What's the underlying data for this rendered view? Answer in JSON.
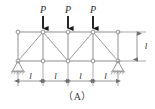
{
  "figure": {
    "caption": "（A）"
  },
  "loads": [
    {
      "label": "P",
      "node": "T2"
    },
    {
      "label": "P",
      "node": "T3"
    },
    {
      "label": "P",
      "node": "T4"
    }
  ],
  "dimensions": {
    "horizontal": [
      {
        "label": "l"
      },
      {
        "label": "l"
      },
      {
        "label": "l"
      },
      {
        "label": "l"
      }
    ],
    "vertical": {
      "label": "l"
    }
  },
  "colors": {
    "member": "#8a8a8a",
    "chord": "#8f8f8f",
    "diagonal": "#9b9b9b",
    "arrow": "#1a1a1a",
    "text": "#2b2b2b",
    "node_fill": "#ffffff",
    "dimension": "#6f6f6f",
    "background": "#ffffff"
  },
  "geometry": {
    "top_chord_y": 32,
    "bottom_chord_y": 61,
    "node_x": [
      18,
      43,
      68,
      93,
      118
    ],
    "panel_count": 4
  },
  "supports": [
    {
      "type": "pin-triangle",
      "node": "B1"
    },
    {
      "type": "pin-triangle",
      "node": "B5"
    }
  ]
}
